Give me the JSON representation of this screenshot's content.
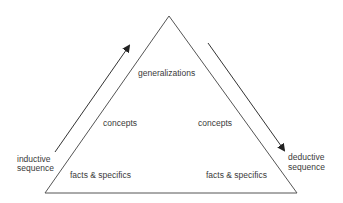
{
  "diagram": {
    "title": "",
    "levels": {
      "top": "generalizations",
      "middle_left": "concepts",
      "middle_right": "concepts",
      "bottom_left": "facts & specifics",
      "bottom_right": "facts & specifics"
    },
    "left_arrow": {
      "label_line1": "inductive",
      "label_line2": "sequence",
      "direction": "up"
    },
    "right_arrow": {
      "label_line1": "deductive",
      "label_line2": "sequence",
      "direction": "down"
    },
    "colors": {
      "line": "#444444",
      "text": "#3a3a3a",
      "background": "#ffffff"
    }
  }
}
